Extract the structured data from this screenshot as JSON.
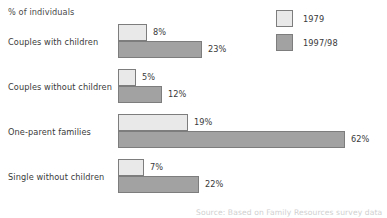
{
  "chart_data": {
    "type": "bar",
    "orientation": "horizontal",
    "title": "",
    "xlabel": "% of individuals",
    "ylabel": "",
    "categories": [
      "Couples with children",
      "Couples without children",
      "One-parent families",
      "Single without children"
    ],
    "series": [
      {
        "name": "1979",
        "color": "#e9e9e9",
        "values": [
          8,
          5,
          19,
          7
        ],
        "labels": [
          "8%",
          "5%",
          "19%",
          "7%"
        ]
      },
      {
        "name": "1997/98",
        "color": "#a2a2a2",
        "values": [
          23,
          12,
          62,
          22
        ],
        "labels": [
          "23%",
          "12%",
          "62%",
          "22%"
        ]
      }
    ],
    "xlim": [
      0,
      65
    ],
    "grid": false,
    "legend_position": "top-right",
    "annotations": [
      "% of individuals"
    ]
  },
  "axis_caption": "% of individuals",
  "legend": {
    "entries": [
      {
        "label": "1979",
        "swatch_color": "#e9e9e9",
        "swatch_name": "legend-swatch-1979"
      },
      {
        "label": "1997/98",
        "swatch_color": "#a2a2a2",
        "swatch_name": "legend-swatch-1997-98"
      }
    ]
  },
  "groups": [
    {
      "label": "Couples with children",
      "bars": [
        {
          "series": "1979",
          "value": 8,
          "value_label": "8%",
          "color": "#e9e9e9"
        },
        {
          "series": "1997/98",
          "value": 23,
          "value_label": "23%",
          "color": "#a2a2a2"
        }
      ]
    },
    {
      "label": "Couples without children",
      "bars": [
        {
          "series": "1979",
          "value": 5,
          "value_label": "5%",
          "color": "#e9e9e9"
        },
        {
          "series": "1997/98",
          "value": 12,
          "value_label": "12%",
          "color": "#a2a2a2"
        }
      ]
    },
    {
      "label": "One-parent families",
      "bars": [
        {
          "series": "1979",
          "value": 19,
          "value_label": "19%",
          "color": "#e9e9e9"
        },
        {
          "series": "1997/98",
          "value": 62,
          "value_label": "62%",
          "color": "#a2a2a2"
        }
      ]
    },
    {
      "label": "Single without children",
      "bars": [
        {
          "series": "1979",
          "value": 7,
          "value_label": "7%",
          "color": "#e9e9e9"
        },
        {
          "series": "1997/98",
          "value": 22,
          "value_label": "22%",
          "color": "#a2a2a2"
        }
      ]
    }
  ],
  "source_note": "Source: Based on Family Resources survey data",
  "style": {
    "bar_border_color": "#7d7d7d",
    "text_color": "#3a3a3a",
    "background": "#ffffff",
    "px_per_percent": 3.66,
    "bar_origin_x": 118
  }
}
